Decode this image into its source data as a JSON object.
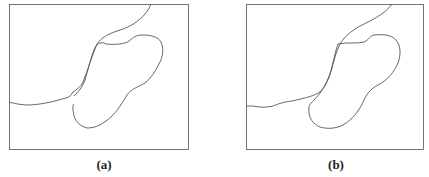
{
  "panels": [
    {
      "id": "a",
      "label": "(a)"
    },
    {
      "id": "b",
      "label": "(b)"
    }
  ],
  "colors": {
    "line": "#555555",
    "frame": "#666666"
  }
}
